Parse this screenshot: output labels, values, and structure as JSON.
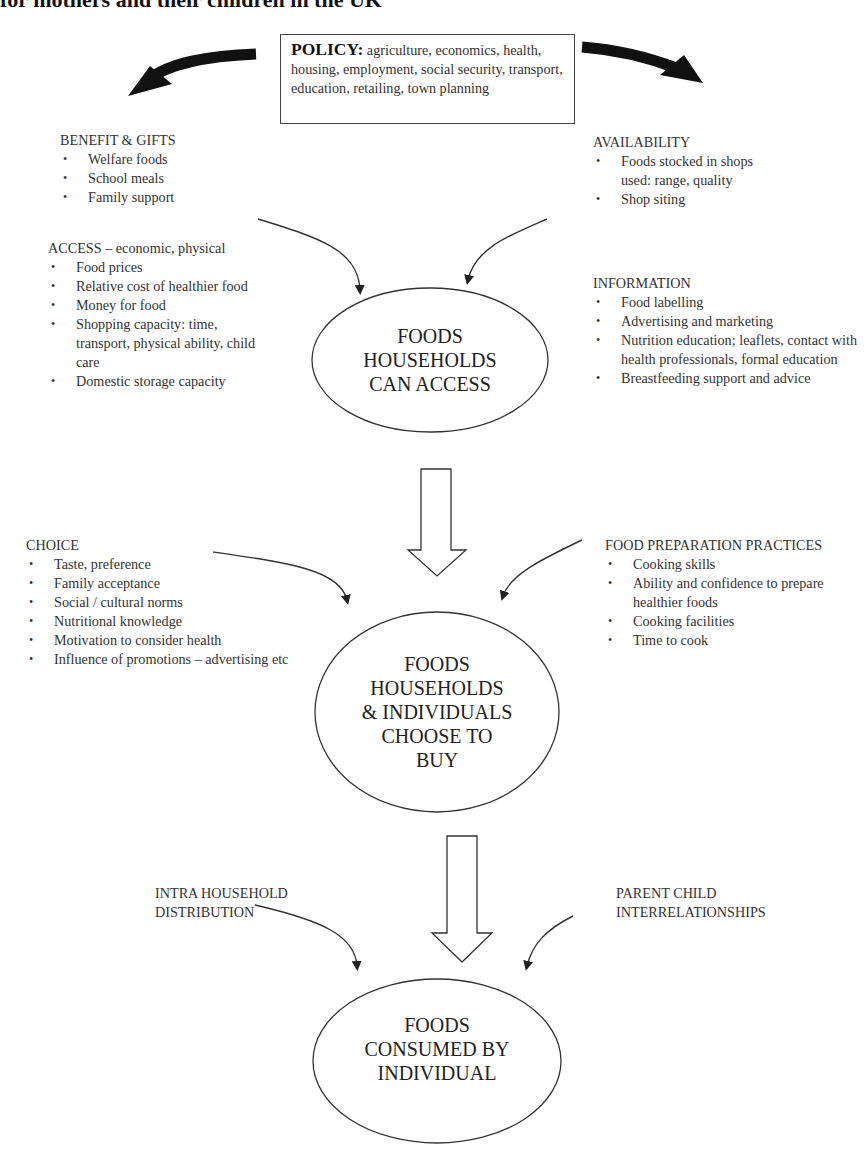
{
  "title": "for mothers and their children in the UK",
  "policy": {
    "label": "POLICY:",
    "text": " agriculture, economics, health, housing, employment, social security, transport, education, retailing, town planning"
  },
  "factors": {
    "benefit_gifts": {
      "heading": "BENEFIT & GIFTS",
      "items": [
        "Welfare foods",
        "School meals",
        "Family support"
      ]
    },
    "availability": {
      "heading": "AVAILABILITY",
      "items": [
        "Foods stocked in shops used: range, quality",
        "Shop siting"
      ]
    },
    "access": {
      "heading": "ACCESS – economic, physical",
      "items": [
        "Food prices",
        "Relative cost of healthier food",
        "Money for food",
        "Shopping capacity: time, transport, physical ability, child care",
        "Domestic storage capacity"
      ]
    },
    "information": {
      "heading": "INFORMATION",
      "items": [
        "Food labelling",
        "Advertising and marketing",
        "Nutrition education; leaflets, contact with health professionals, formal education",
        "Breastfeeding support and advice"
      ]
    },
    "choice": {
      "heading": "CHOICE",
      "items": [
        "Taste, preference",
        "Family acceptance",
        "Social / cultural norms",
        "Nutritional knowledge",
        "Motivation to consider health",
        "Influence of promotions – advertising etc"
      ]
    },
    "food_preparation": {
      "heading": "FOOD PREPARATION PRACTICES",
      "items": [
        "Cooking skills",
        "Ability and confidence to prepare healthier foods",
        "Cooking facilities",
        "Time to cook"
      ]
    },
    "intra_household": {
      "heading_line1": "INTRA HOUSEHOLD",
      "heading_line2": "DISTRIBUTION"
    },
    "parent_child": {
      "heading_line1": "PARENT CHILD",
      "heading_line2": "INTERRELATIONSHIPS"
    }
  },
  "nodes": {
    "access_node": {
      "lines": [
        "FOODS",
        "HOUSEHOLDS",
        "CAN ACCESS"
      ]
    },
    "choose_node": {
      "lines": [
        "FOODS",
        "HOUSEHOLDS",
        "& INDIVIDUALS",
        "CHOOSE TO",
        "BUY"
      ]
    },
    "consumed_node": {
      "lines": [
        "FOODS",
        "CONSUMED BY",
        "INDIVIDUAL"
      ]
    }
  },
  "colors": {
    "ink": "#222222",
    "line": "#333333",
    "background": "#ffffff"
  }
}
